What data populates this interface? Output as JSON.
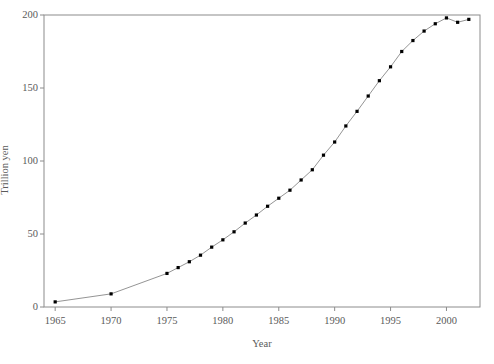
{
  "chart_data": {
    "type": "line",
    "title": "",
    "subtitle": "",
    "xlabel": "Year",
    "ylabel": "Trillion yen",
    "xlim": [
      1964,
      2003
    ],
    "ylim": [
      0,
      200
    ],
    "xticks": [
      1965,
      1970,
      1975,
      1980,
      1985,
      1990,
      1995,
      2000
    ],
    "yticks": [
      0,
      50,
      100,
      150,
      200
    ],
    "grid": false,
    "legend": null,
    "marker": "square",
    "marker_color": "#000000",
    "line_color": "#888888",
    "axis_color": "#8c8c8c",
    "x": [
      1965,
      1970,
      1975,
      1976,
      1977,
      1978,
      1979,
      1980,
      1981,
      1982,
      1983,
      1984,
      1985,
      1986,
      1987,
      1988,
      1989,
      1990,
      1991,
      1992,
      1993,
      1994,
      1995,
      1996,
      1997,
      1998,
      1999,
      2000,
      2001,
      2002
    ],
    "values": [
      3.5,
      9,
      23,
      27,
      31,
      35.5,
      41,
      46,
      51.5,
      57.5,
      63,
      69,
      74.5,
      80,
      87,
      94,
      104,
      113,
      124,
      134,
      144.5,
      155,
      164.5,
      175,
      182.5,
      189,
      194,
      198,
      195,
      197
    ],
    "series": [
      {
        "name": "",
        "values": [
          3.5,
          9,
          23,
          27,
          31,
          35.5,
          41,
          46,
          51.5,
          57.5,
          63,
          69,
          74.5,
          80,
          87,
          94,
          104,
          113,
          124,
          134,
          144.5,
          155,
          164.5,
          175,
          182.5,
          189,
          194,
          198,
          195,
          197
        ]
      }
    ],
    "xtick_labels": [
      "1965",
      "1970",
      "1975",
      "1980",
      "1985",
      "1990",
      "1995",
      "2000"
    ],
    "ytick_labels": [
      "0",
      "50",
      "100",
      "150",
      "200"
    ]
  }
}
